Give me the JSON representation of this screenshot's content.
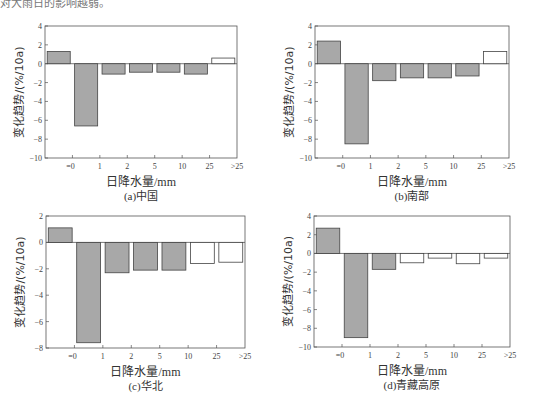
{
  "page": {
    "top_fragment": "对大雨日的影响越弱。"
  },
  "colors": {
    "significant_fill": "#a8a8a8",
    "nonsignificant_fill": "#ffffff",
    "stroke": "#444444",
    "axis": "#555555"
  },
  "chart_data": [
    {
      "type": "bar",
      "title": "(a)中国",
      "xlabel": "日降水量/mm",
      "ylabel": "变化趋势/(%/10a)",
      "tick_labels": [
        "=0",
        "1",
        "2",
        "5",
        "10",
        "25",
        ">25"
      ],
      "values": [
        1.3,
        -6.6,
        -1.1,
        -0.9,
        -0.9,
        -1.1,
        0.6
      ],
      "significant": [
        true,
        true,
        true,
        true,
        true,
        true,
        false
      ],
      "ylim": [
        -10,
        4
      ],
      "yticks": [
        4,
        2,
        0,
        -2,
        -4,
        -6,
        -8,
        -10
      ],
      "grid": false
    },
    {
      "type": "bar",
      "title": "(b)南部",
      "xlabel": "日降水量/mm",
      "ylabel": "变化趋势/(%/10a)",
      "tick_labels": [
        "=0",
        "1",
        "2",
        "5",
        "10",
        "25",
        ">25"
      ],
      "values": [
        2.4,
        -8.5,
        -1.8,
        -1.5,
        -1.5,
        -1.3,
        1.3
      ],
      "significant": [
        true,
        true,
        true,
        true,
        true,
        true,
        false
      ],
      "ylim": [
        -10,
        4
      ],
      "yticks": [
        4,
        2,
        0,
        -2,
        -4,
        -6,
        -8,
        -10
      ],
      "grid": false
    },
    {
      "type": "bar",
      "title": "(c)华北",
      "xlabel": "日降水量/mm",
      "ylabel": "变化趋势/(%/10a)",
      "tick_labels": [
        "=0",
        "1",
        "2",
        "5",
        "10",
        "25",
        ">25"
      ],
      "values": [
        1.1,
        -7.6,
        -2.3,
        -2.1,
        -2.1,
        -1.6,
        -1.5
      ],
      "significant": [
        true,
        true,
        true,
        true,
        true,
        false,
        false
      ],
      "ylim": [
        -8,
        2
      ],
      "yticks": [
        2,
        0,
        -2,
        -4,
        -6,
        -8
      ],
      "grid": false
    },
    {
      "type": "bar",
      "title": "(d)青藏高原",
      "xlabel": "日降水量/mm",
      "ylabel": "变化趋势/(%/10a)",
      "tick_labels": [
        "=0",
        "1",
        "2",
        "5",
        "10",
        "25",
        ">25"
      ],
      "values": [
        2.7,
        -9.0,
        -1.7,
        -1.0,
        -0.5,
        -1.1,
        -0.5
      ],
      "significant": [
        true,
        true,
        true,
        false,
        false,
        false,
        false
      ],
      "ylim": [
        -10,
        4
      ],
      "yticks": [
        4,
        2,
        0,
        -2,
        -4,
        -6,
        -8,
        -10
      ],
      "grid": false
    }
  ],
  "layout": [
    {
      "left": 45,
      "top": 26,
      "width": 192,
      "height": 132
    },
    {
      "left": 315,
      "top": 26,
      "width": 194,
      "height": 132
    },
    {
      "left": 46,
      "top": 216,
      "width": 199,
      "height": 132
    },
    {
      "left": 314,
      "top": 216,
      "width": 196,
      "height": 131
    }
  ]
}
